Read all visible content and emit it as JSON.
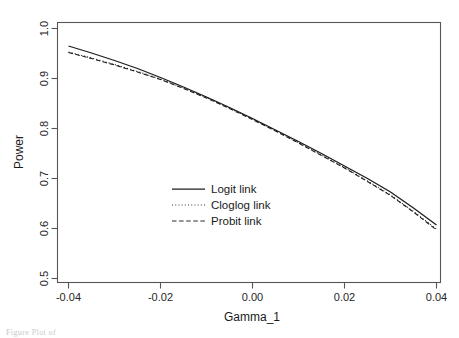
{
  "figure": {
    "caption_fragment": "Figure  Plot of"
  },
  "chart_data": {
    "type": "line",
    "title": "",
    "xlabel": "Gamma_1",
    "ylabel": "Power",
    "xlim": [
      -0.04,
      0.04
    ],
    "ylim": [
      0.5,
      1.0
    ],
    "grid": false,
    "xticks": [
      -0.04,
      -0.02,
      0.0,
      0.02,
      0.04
    ],
    "xtick_labels": [
      "-0.04",
      "-0.02",
      "0.00",
      "0.02",
      "0.04"
    ],
    "yticks": [
      0.5,
      0.6,
      0.7,
      0.8,
      0.9,
      1.0
    ],
    "ytick_labels": [
      "0.5",
      "0.6",
      "0.7",
      "0.8",
      "0.9",
      "1.0"
    ],
    "legend_position": "center",
    "x": [
      -0.04,
      -0.035,
      -0.03,
      -0.025,
      -0.02,
      -0.015,
      -0.01,
      -0.005,
      0.0,
      0.005,
      0.01,
      0.015,
      0.02,
      0.025,
      0.03,
      0.035,
      0.04
    ],
    "series": [
      {
        "name": "Logit link",
        "dash": "solid",
        "color": "#1c1c1c",
        "values": [
          0.965,
          0.951,
          0.936,
          0.92,
          0.902,
          0.883,
          0.863,
          0.842,
          0.82,
          0.797,
          0.774,
          0.75,
          0.725,
          0.7,
          0.673,
          0.641,
          0.607
        ]
      },
      {
        "name": "Cloglog link",
        "dash": "dotted",
        "color": "#333333",
        "values": [
          0.953,
          0.941,
          0.928,
          0.914,
          0.899,
          0.881,
          0.862,
          0.841,
          0.819,
          0.796,
          0.772,
          0.747,
          0.722,
          0.695,
          0.667,
          0.634,
          0.599
        ]
      },
      {
        "name": "Probit link",
        "dash": "dashed",
        "color": "#2b2b2b",
        "values": [
          0.952,
          0.94,
          0.927,
          0.913,
          0.898,
          0.88,
          0.861,
          0.84,
          0.818,
          0.795,
          0.771,
          0.746,
          0.721,
          0.694,
          0.666,
          0.633,
          0.597
        ]
      }
    ],
    "legend": [
      {
        "label": "Logit link",
        "dash": "solid"
      },
      {
        "label": "Cloglog link",
        "dash": "dotted"
      },
      {
        "label": "Probit link",
        "dash": "dashed"
      }
    ]
  }
}
